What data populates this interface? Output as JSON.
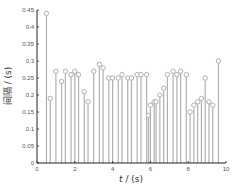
{
  "chart_data": {
    "type": "stem",
    "title": "",
    "xlabel": "t / (s)",
    "ylabel": "间隔 / (s)",
    "xlim": [
      0,
      10
    ],
    "ylim": [
      0,
      0.45
    ],
    "xticks": [
      0,
      2,
      4,
      6,
      8,
      10
    ],
    "yticks": [
      0,
      0.05,
      0.1,
      0.15,
      0.2,
      0.25,
      0.3,
      0.35,
      0.4,
      0.45
    ],
    "ytick_labels": [
      "0",
      "0.05",
      "0.1",
      "0.15",
      "0.2",
      "0.25",
      "0.3",
      "0.35",
      "0.4",
      "0.45"
    ],
    "grid": false,
    "marker": "open-circle",
    "color": "#b0b0b0",
    "x": [
      0.5,
      0.7,
      1.0,
      1.3,
      1.5,
      1.8,
      2.0,
      2.2,
      2.5,
      2.7,
      3.0,
      3.3,
      3.5,
      3.8,
      4.0,
      4.3,
      4.5,
      4.8,
      5.0,
      5.3,
      5.5,
      5.8,
      5.9,
      6.0,
      6.2,
      6.3,
      6.5,
      6.7,
      6.9,
      7.2,
      7.4,
      7.6,
      7.9,
      8.1,
      8.3,
      8.5,
      8.7,
      8.9,
      9.1,
      9.3,
      9.6
    ],
    "values": [
      0.44,
      0.19,
      0.27,
      0.24,
      0.27,
      0.26,
      0.27,
      0.26,
      0.21,
      0.18,
      0.27,
      0.29,
      0.28,
      0.25,
      0.25,
      0.25,
      0.26,
      0.25,
      0.25,
      0.26,
      0.26,
      0.26,
      0.14,
      0.17,
      0.18,
      0.18,
      0.2,
      0.22,
      0.26,
      0.27,
      0.26,
      0.27,
      0.26,
      0.15,
      0.17,
      0.18,
      0.19,
      0.25,
      0.18,
      0.17,
      0.3
    ]
  },
  "labels": {
    "xlabel_italic": "t",
    "xlabel_rest": " / (s)",
    "ylabel": "间隔 / (s)"
  }
}
